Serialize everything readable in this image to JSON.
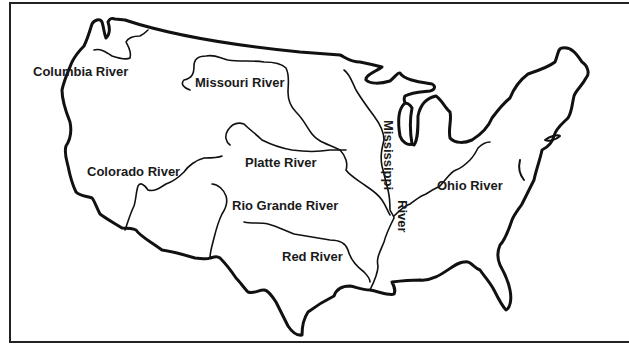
{
  "map": {
    "title": "",
    "region": "United States (contiguous)",
    "colors": {
      "ink": "#111111",
      "background": "#ffffff"
    },
    "labels": [
      {
        "id": "columbia",
        "text": "Columbia River",
        "x": 33,
        "y": 65
      },
      {
        "id": "missouri",
        "text": "Missouri River",
        "x": 195,
        "y": 76
      },
      {
        "id": "colorado",
        "text": "Colorado River",
        "x": 87,
        "y": 165
      },
      {
        "id": "platte",
        "text": "Platte River",
        "x": 245,
        "y": 156
      },
      {
        "id": "mississippi",
        "text": "Mississippi",
        "x": 382,
        "y": 120,
        "vertical": true
      },
      {
        "id": "mississippi-river",
        "text": "River",
        "x": 396,
        "y": 200,
        "vertical": true
      },
      {
        "id": "ohio",
        "text": "Ohio River",
        "x": 437,
        "y": 179
      },
      {
        "id": "rio-grande",
        "text": "Rio Grande River",
        "x": 232,
        "y": 199
      },
      {
        "id": "red",
        "text": "Red River",
        "x": 282,
        "y": 250
      }
    ]
  }
}
